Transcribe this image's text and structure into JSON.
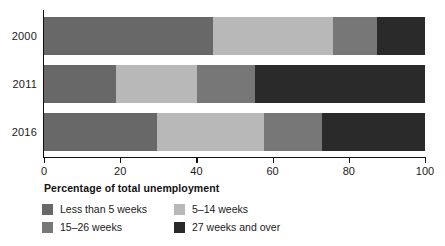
{
  "chart_data": {
    "type": "bar",
    "subtype": "stacked-horizontal-100-percent",
    "title": "",
    "xlabel": "Percentage of total unemployment",
    "ylabel": "",
    "categories": [
      "2000",
      "2011",
      "2016"
    ],
    "xlim": [
      0,
      100
    ],
    "xticks": [
      0,
      20,
      40,
      60,
      80,
      100
    ],
    "xtick_labels": [
      "0",
      "20",
      "40",
      "60",
      "80",
      "100"
    ],
    "grid": false,
    "legend_position": "bottom-left",
    "series": [
      {
        "name": "Less than 5 weeks",
        "color": "#686868",
        "values": [
          44.4,
          18.9,
          29.7
        ]
      },
      {
        "name": "5–14 weeks",
        "color": "#b8b8b8",
        "values": [
          31.5,
          21.3,
          28.0
        ]
      },
      {
        "name": "15–26 weeks",
        "color": "#777777",
        "values": [
          11.5,
          15.2,
          15.3
        ]
      },
      {
        "name": "27 weeks and over",
        "color": "#2a2a2a",
        "values": [
          12.6,
          44.6,
          27.0
        ]
      }
    ],
    "cumulative_boundaries": {
      "2000": [
        44.4,
        75.9,
        87.4,
        100
      ],
      "2011": [
        18.9,
        40.2,
        55.4,
        100
      ],
      "2016": [
        29.7,
        57.7,
        73.0,
        100
      ]
    }
  },
  "axis": {
    "x_title": "Percentage of total unemployment",
    "tick_0": "0",
    "tick_1": "20",
    "tick_2": "40",
    "tick_3": "60",
    "tick_4": "80",
    "tick_5": "100"
  },
  "years": {
    "y0": "2000",
    "y1": "2011",
    "y2": "2016"
  },
  "legend": {
    "item_0": "Less than 5 weeks",
    "item_1": "5–14 weeks",
    "item_2": "15–26 weeks",
    "item_3": "27 weeks and over"
  },
  "colors": {
    "less_than_5": "#686868",
    "five_to_14": "#b8b8b8",
    "fifteen_to_26": "#777777",
    "twentyseven_plus": "#2a2a2a",
    "axis": "#111111",
    "text": "#1a1a1a",
    "background": "#ffffff"
  }
}
